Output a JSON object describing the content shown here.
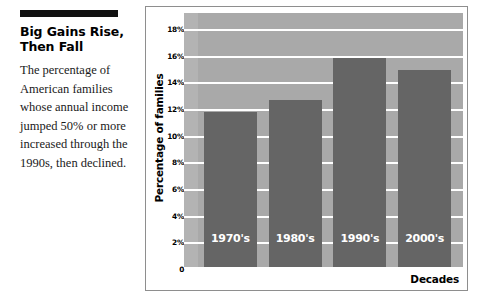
{
  "article": {
    "headline": "Big Gains Rise,\nThen Fall",
    "body": "The percentage of American families whose annual income jumped 50% or more increased through the 1990s, then declined."
  },
  "chart_data": {
    "type": "bar",
    "title": "",
    "xlabel": "Decades",
    "ylabel": "Percentage of families",
    "categories": [
      "1970's",
      "1980's",
      "1990's",
      "2000's"
    ],
    "values": [
      11.8,
      12.7,
      15.8,
      14.9
    ],
    "ylim": [
      0,
      19.2
    ],
    "yticks": [
      0,
      2,
      4,
      6,
      8,
      10,
      12,
      14,
      16,
      18
    ],
    "ytick_labels": [
      "0",
      "2%",
      "4%",
      "6%",
      "8%",
      "10%",
      "12%",
      "14%",
      "16%",
      "18%"
    ],
    "grid": true,
    "legend": false,
    "colors": {
      "bar": "#656565",
      "plot_background": "#a9a9a9",
      "axis_strip": "#b3b3b3",
      "gridline": "#ffffff",
      "bar_label_text": "#ffffff",
      "frame_border": "#8e8e8e",
      "rule": "#111111"
    }
  }
}
